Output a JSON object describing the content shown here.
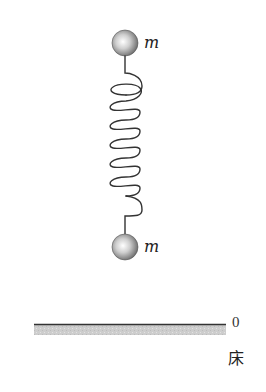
{
  "diagram": {
    "type": "physics-spring-mass",
    "masses": [
      {
        "id": "top-mass",
        "label": "m",
        "cx": 125,
        "cy": 43,
        "r": 13
      },
      {
        "id": "bottom-mass",
        "label": "m",
        "cx": 125,
        "cy": 247,
        "r": 13
      }
    ],
    "spring": {
      "coil_count": 6,
      "x_left": 110,
      "x_right": 142,
      "top_attach_y": 56,
      "bottom_attach_y": 234
    },
    "floor": {
      "x1": 34,
      "x2": 226,
      "y": 324,
      "band_height": 10,
      "height_label": "0",
      "label": "床"
    },
    "colors": {
      "line": "#333333",
      "floor_band": "#c8c8c8",
      "ball_light": "#ffffff",
      "ball_dark": "#6a6a6a"
    }
  }
}
